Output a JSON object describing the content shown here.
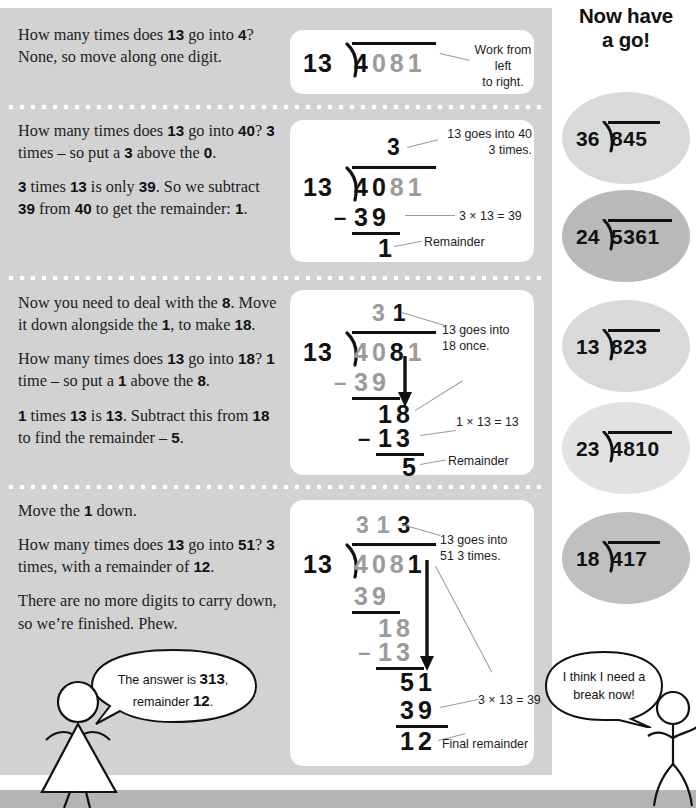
{
  "page": {
    "panel_bg": "#d2d2d2",
    "card_bg": "#ffffff",
    "ink": "#111111",
    "faded_ink": "#9b9b9b"
  },
  "lesson": {
    "steps": [
      {
        "id": "step-1",
        "paragraphs": [
          [
            {
              "t": "How many times does ",
              "b": false
            },
            {
              "t": "13",
              "b": true
            },
            {
              "t": " go into ",
              "b": false
            },
            {
              "t": "4",
              "b": true
            },
            {
              "t": "? None, so move along one digit.",
              "b": false
            }
          ]
        ]
      },
      {
        "id": "step-2",
        "paragraphs": [
          [
            {
              "t": "How many times does ",
              "b": false
            },
            {
              "t": "13",
              "b": true
            },
            {
              "t": " go into ",
              "b": false
            },
            {
              "t": "40",
              "b": true
            },
            {
              "t": "? ",
              "b": false
            },
            {
              "t": "3",
              "b": true
            },
            {
              "t": " times – so put a ",
              "b": false
            },
            {
              "t": "3",
              "b": true
            },
            {
              "t": " above the ",
              "b": false
            },
            {
              "t": "0",
              "b": true
            },
            {
              "t": ".",
              "b": false
            }
          ],
          [
            {
              "t": "3",
              "b": true
            },
            {
              "t": " times ",
              "b": false
            },
            {
              "t": "13",
              "b": true
            },
            {
              "t": " is only ",
              "b": false
            },
            {
              "t": "39",
              "b": true
            },
            {
              "t": ". So we subtract ",
              "b": false
            },
            {
              "t": "39",
              "b": true
            },
            {
              "t": " from ",
              "b": false
            },
            {
              "t": "40",
              "b": true
            },
            {
              "t": " to get the remainder: ",
              "b": false
            },
            {
              "t": "1",
              "b": true
            },
            {
              "t": ".",
              "b": false
            }
          ]
        ]
      },
      {
        "id": "step-3",
        "paragraphs": [
          [
            {
              "t": "Now you need to deal with the ",
              "b": false
            },
            {
              "t": "8",
              "b": true
            },
            {
              "t": ". Move it down alongside the ",
              "b": false
            },
            {
              "t": "1",
              "b": true
            },
            {
              "t": ", to make ",
              "b": false
            },
            {
              "t": "18",
              "b": true
            },
            {
              "t": ".",
              "b": false
            }
          ],
          [
            {
              "t": "How many times does ",
              "b": false
            },
            {
              "t": "13",
              "b": true
            },
            {
              "t": " go into ",
              "b": false
            },
            {
              "t": "18",
              "b": true
            },
            {
              "t": "? ",
              "b": false
            },
            {
              "t": "1",
              "b": true
            },
            {
              "t": " time – so put a ",
              "b": false
            },
            {
              "t": "1",
              "b": true
            },
            {
              "t": " above the ",
              "b": false
            },
            {
              "t": "8",
              "b": true
            },
            {
              "t": ".",
              "b": false
            }
          ],
          [
            {
              "t": "1",
              "b": true
            },
            {
              "t": " times ",
              "b": false
            },
            {
              "t": "13",
              "b": true
            },
            {
              "t": " is ",
              "b": false
            },
            {
              "t": "13",
              "b": true
            },
            {
              "t": ". Subtract this from ",
              "b": false
            },
            {
              "t": "18",
              "b": true
            },
            {
              "t": " to find the remainder – ",
              "b": false
            },
            {
              "t": "5",
              "b": true
            },
            {
              "t": ".",
              "b": false
            }
          ]
        ]
      },
      {
        "id": "step-4",
        "paragraphs": [
          [
            {
              "t": "Move the ",
              "b": false
            },
            {
              "t": "1",
              "b": true
            },
            {
              "t": " down.",
              "b": false
            }
          ],
          [
            {
              "t": "How many times does ",
              "b": false
            },
            {
              "t": "13",
              "b": true
            },
            {
              "t": " go into ",
              "b": false
            },
            {
              "t": "51",
              "b": true
            },
            {
              "t": "? ",
              "b": false
            },
            {
              "t": "3",
              "b": true
            },
            {
              "t": " times, with a remainder of ",
              "b": false
            },
            {
              "t": "12",
              "b": true
            },
            {
              "t": ".",
              "b": false
            }
          ],
          [
            {
              "t": "There are no more digits to carry down, so we’re finished. Phew.",
              "b": false
            }
          ]
        ]
      }
    ]
  },
  "worked_sums": [
    {
      "id": "sum-1",
      "divisor": "13",
      "dividend_digits": [
        {
          "d": "4",
          "dim": false
        },
        {
          "d": "0",
          "dim": true
        },
        {
          "d": "8",
          "dim": true
        },
        {
          "d": "1",
          "dim": true
        }
      ],
      "quotient_digits": [],
      "rows": [],
      "callouts": [
        {
          "id": "callout-work-left-right",
          "text": "Work from left\nto right."
        }
      ]
    },
    {
      "id": "sum-2",
      "divisor": "13",
      "dividend_digits": [
        {
          "d": "4",
          "dim": false
        },
        {
          "d": "0",
          "dim": false
        },
        {
          "d": "8",
          "dim": true
        },
        {
          "d": "1",
          "dim": true
        }
      ],
      "quotient_digits": [
        {
          "d": "3",
          "dim": false
        }
      ],
      "rows": [
        {
          "sign": "–",
          "value": "39",
          "dim": false
        },
        {
          "sign": "",
          "value": "1",
          "dim": false
        }
      ],
      "callouts": [
        {
          "id": "callout-13-into-40",
          "text": "13 goes into 40\n3 times."
        },
        {
          "id": "callout-3x13",
          "text": "3 × 13 = 39"
        },
        {
          "id": "callout-remainder-1",
          "text": "Remainder"
        }
      ]
    },
    {
      "id": "sum-3",
      "divisor": "13",
      "dividend_digits": [
        {
          "d": "4",
          "dim": true
        },
        {
          "d": "0",
          "dim": true
        },
        {
          "d": "8",
          "dim": false
        },
        {
          "d": "1",
          "dim": true
        }
      ],
      "quotient_digits": [
        {
          "d": "3",
          "dim": true
        },
        {
          "d": "1",
          "dim": false
        }
      ],
      "rows": [
        {
          "sign": "–",
          "value": "39",
          "dim": true
        },
        {
          "sign": "",
          "value": "18",
          "dim": false
        },
        {
          "sign": "–",
          "value": "13",
          "dim": false
        },
        {
          "sign": "",
          "value": "5",
          "dim": false
        }
      ],
      "callouts": [
        {
          "id": "callout-13-into-18",
          "text": "13 goes into\n18 once."
        },
        {
          "id": "callout-1x13",
          "text": "1 × 13 = 13"
        },
        {
          "id": "callout-remainder-5",
          "text": "Remainder"
        }
      ]
    },
    {
      "id": "sum-4",
      "divisor": "13",
      "dividend_digits": [
        {
          "d": "4",
          "dim": true
        },
        {
          "d": "0",
          "dim": true
        },
        {
          "d": "8",
          "dim": true
        },
        {
          "d": "1",
          "dim": false
        }
      ],
      "quotient_digits": [
        {
          "d": "3",
          "dim": true
        },
        {
          "d": "1",
          "dim": true
        },
        {
          "d": "3",
          "dim": false
        }
      ],
      "rows": [
        {
          "sign": "",
          "value": "39",
          "dim": true
        },
        {
          "sign": "",
          "value": "18",
          "dim": true
        },
        {
          "sign": "–",
          "value": "13",
          "dim": true
        },
        {
          "sign": "",
          "value": "51",
          "dim": false
        },
        {
          "sign": "",
          "value": "39",
          "dim": false
        },
        {
          "sign": "",
          "value": "12",
          "dim": false
        }
      ],
      "callouts": [
        {
          "id": "callout-13-into-51",
          "text": "13 goes into\n51 3 times."
        },
        {
          "id": "callout-3x13-final",
          "text": "3 × 13 = 39"
        },
        {
          "id": "callout-final-remainder",
          "text": "Final remainder"
        }
      ]
    }
  ],
  "practice": {
    "heading_line1": "Now have",
    "heading_line2": "a go!",
    "problems": [
      {
        "id": "practice-1",
        "divisor": "36",
        "dividend": "845",
        "shade": "#d9d9d9"
      },
      {
        "id": "practice-2",
        "divisor": "24",
        "dividend": "5361",
        "shade": "#b9b9b9"
      },
      {
        "id": "practice-3",
        "divisor": "13",
        "dividend": "823",
        "shade": "#d9d9d9"
      },
      {
        "id": "practice-4",
        "divisor": "23",
        "dividend": "4810",
        "shade": "#e2e2e2"
      },
      {
        "id": "practice-5",
        "divisor": "18",
        "dividend": "417",
        "shade": "#bfbfbf"
      }
    ]
  },
  "characters": {
    "left": {
      "id": "character-left",
      "bubble": [
        {
          "t": "The answer is ",
          "b": false
        },
        {
          "t": "313",
          "b": true
        },
        {
          "t": ",",
          "b": false
        },
        {
          "t": "\n",
          "b": false
        },
        {
          "t": "remainder ",
          "b": false
        },
        {
          "t": "12",
          "b": true
        },
        {
          "t": ".",
          "b": false
        }
      ]
    },
    "right": {
      "id": "character-right",
      "bubble": [
        {
          "t": "I think I need a",
          "b": false
        },
        {
          "t": "\n",
          "b": false
        },
        {
          "t": "break now!",
          "b": false
        }
      ]
    }
  }
}
